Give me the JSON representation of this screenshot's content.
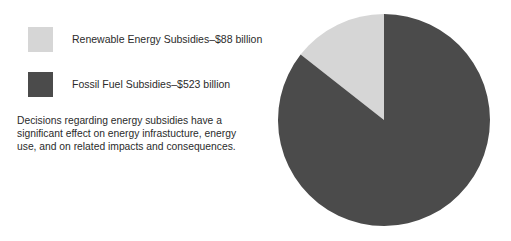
{
  "legend": {
    "items": [
      {
        "label": "Renewable Energy Subsidies–$88 billion",
        "swatch_name": "legend-swatch-renewable",
        "color": "#d6d6d6"
      },
      {
        "label": "Fossil Fuel Subsidies–$523 billion",
        "swatch_name": "legend-swatch-fossil",
        "color": "#4b4b4b"
      }
    ]
  },
  "caption": {
    "line1": "Decisions regarding energy subsidies have a",
    "line2": "significant effect on energy infrastucture, energy",
    "line3": "use, and on related impacts and consequences."
  },
  "chart_data": {
    "type": "pie",
    "title": "",
    "categories": [
      "Renewable Energy Subsidies",
      "Fossil Fuel Subsidies"
    ],
    "values": [
      88,
      523
    ],
    "value_unit": "billion USD",
    "value_labels": [
      "$88 billion",
      "$523 billion"
    ],
    "percentages": [
      14.4,
      85.6
    ],
    "colors": [
      "#d6d6d6",
      "#4b4b4b"
    ],
    "start_angle_deg": 0,
    "direction": "counterclockwise",
    "legend_position": "left",
    "grid": false,
    "geometry": {
      "cx": 108,
      "cy": 108,
      "r": 106
    }
  }
}
